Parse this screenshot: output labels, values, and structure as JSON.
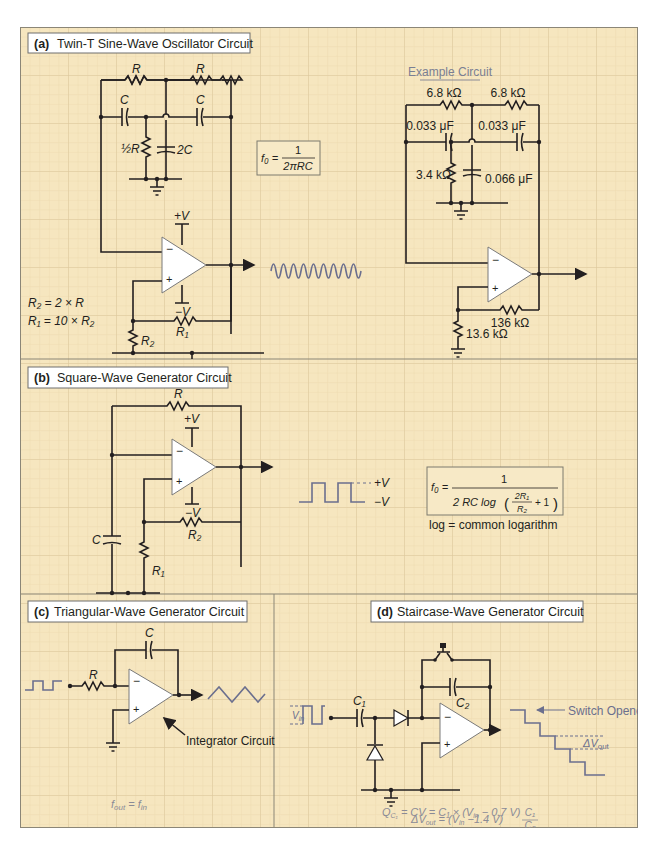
{
  "colors": {
    "background": "#f6e6bf",
    "grid_minor": "#ead7aa",
    "grid_major": "#dcc89a",
    "wire": "#231f20",
    "waveform": "#6b6f8e",
    "section_divider": "#8b8677",
    "annotation_gray": "#8a8a96"
  },
  "sections": {
    "a": {
      "tag": "(a)",
      "title": "Twin-T Sine-Wave Oscillator Circuit",
      "labels": {
        "r_left": "R",
        "r_right": "R",
        "c_left": "C",
        "c_right": "C",
        "half_r": "½R",
        "two_c": "2C",
        "plus_v": "+V",
        "minus_v": "−V",
        "inv_in": "−",
        "noninv_in": "+",
        "r1": "R₁",
        "r2": "R₂"
      },
      "equations": {
        "r2_rule": "R₂ = 2 × R",
        "r1_rule": "R₁ = 10 × R₂"
      },
      "formula": {
        "lhs": "f₀ =",
        "numerator": "1",
        "denominator": "2πRC"
      },
      "output_waveform": "sine",
      "example": {
        "title": "Example Circuit",
        "r_left": "6.8 kΩ",
        "r_right": "6.8 kΩ",
        "c_left": "0.033 μF",
        "c_right": "0.033 μF",
        "r_shunt": "3.4 kΩ",
        "c_shunt": "0.066 μF",
        "r_feedback": "136 kΩ",
        "r_ground": "13.6 kΩ",
        "inv_in": "−",
        "noninv_in": "+"
      }
    },
    "b": {
      "tag": "(b)",
      "title": "Square-Wave Generator Circuit",
      "labels": {
        "r": "R",
        "c": "C",
        "r1": "R₁",
        "r2": "R₂",
        "plus_v": "+V",
        "minus_v": "−V",
        "inv_in": "−",
        "noninv_in": "+"
      },
      "waveform_levels": {
        "high": "+V",
        "low": "−V"
      },
      "formula": {
        "lhs": "f₀ =",
        "numerator": "1",
        "denominator_prefix": "2 RC log",
        "inner_numerator": "2R₁",
        "inner_denominator": "R₂",
        "inner_suffix": "+ 1"
      },
      "note": "log = common logarithm"
    },
    "c": {
      "tag": "(c)",
      "title": "Triangular-Wave Generator Circuit",
      "labels": {
        "r": "R",
        "c": "C",
        "inv_in": "−",
        "noninv_in": "+"
      },
      "callout": "Integrator Circuit",
      "relation": "f_out = f_in",
      "relation_lhs": "f",
      "relation_lhs_sub": "out",
      "relation_eq": " = ",
      "relation_rhs": "f",
      "relation_rhs_sub": "in"
    },
    "d": {
      "tag": "(d)",
      "title": "Staircase-Wave Generator Circuit",
      "labels": {
        "c1": "C₁",
        "c2": "C₂",
        "vin": "V",
        "vin_sub": "in",
        "inv_in": "−",
        "noninv_in": "+"
      },
      "callout": "Switch Opened",
      "delta_label": "ΔV",
      "delta_sub": "out",
      "eq1": "Q_C1 = CV = C₁ × (V_in − 0.7 V)",
      "eq1_parts": {
        "q": "Q",
        "q_sub": "C₁",
        "mid": " = CV = C₁ × (V",
        "vin_sub": "in",
        "tail": " − 0.7 V)"
      },
      "eq2": "ΔV_out = (V_in − 1.4 V) C₁/C₂",
      "eq2_parts": {
        "lhs": "ΔV",
        "lhs_sub": "out",
        "mid": " = (V",
        "vin_sub": "in",
        "tail": " −1.4 V)",
        "frac_num": "C₁",
        "frac_den": "C₂"
      }
    }
  }
}
